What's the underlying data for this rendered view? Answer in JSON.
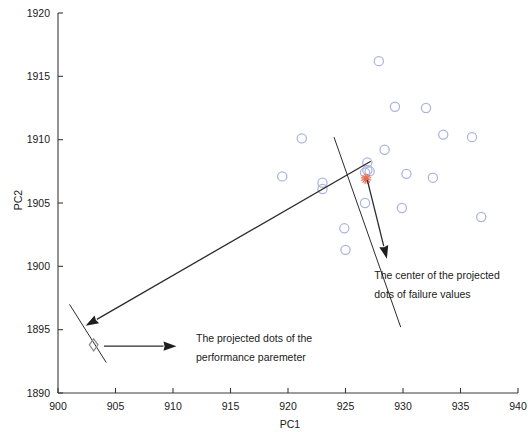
{
  "chart_data": {
    "type": "scatter",
    "title": "",
    "xlabel": "PC1",
    "ylabel": "PC2",
    "xlim": [
      900,
      940
    ],
    "ylim": [
      1890,
      1920
    ],
    "xticks": [
      900,
      905,
      910,
      915,
      920,
      925,
      930,
      935,
      940
    ],
    "xtick_labels": [
      "900",
      "905",
      "910",
      "915",
      "920",
      "925",
      "930",
      "935",
      "940"
    ],
    "yticks": [
      1890,
      1895,
      1900,
      1905,
      1910,
      1915,
      1920
    ],
    "ytick_labels": [
      "1890",
      "1895",
      "1900",
      "1905",
      "1910",
      "1915",
      "1920"
    ],
    "grid": false,
    "legend": null,
    "series": [
      {
        "name": "failure values",
        "marker": "open-circle",
        "color": "#aab4dd",
        "points": [
          {
            "x": 927.9,
            "y": 1916.2
          },
          {
            "x": 929.3,
            "y": 1912.6
          },
          {
            "x": 932.0,
            "y": 1912.5
          },
          {
            "x": 921.2,
            "y": 1910.1
          },
          {
            "x": 933.5,
            "y": 1910.4
          },
          {
            "x": 936.0,
            "y": 1910.2
          },
          {
            "x": 928.4,
            "y": 1909.2
          },
          {
            "x": 926.9,
            "y": 1908.2
          },
          {
            "x": 926.9,
            "y": 1907.6
          },
          {
            "x": 926.7,
            "y": 1907.4
          },
          {
            "x": 927.1,
            "y": 1907.5
          },
          {
            "x": 930.3,
            "y": 1907.3
          },
          {
            "x": 932.6,
            "y": 1907.0
          },
          {
            "x": 919.5,
            "y": 1907.1
          },
          {
            "x": 923.0,
            "y": 1906.6
          },
          {
            "x": 923.0,
            "y": 1906.1
          },
          {
            "x": 926.7,
            "y": 1905.0
          },
          {
            "x": 929.9,
            "y": 1904.6
          },
          {
            "x": 936.8,
            "y": 1903.9
          },
          {
            "x": 924.9,
            "y": 1903.0
          },
          {
            "x": 925.0,
            "y": 1901.3
          }
        ]
      },
      {
        "name": "center of projected failure dots",
        "marker": "asterisk",
        "color": "#e8694a",
        "points": [
          {
            "x": 926.8,
            "y": 1906.9
          }
        ]
      },
      {
        "name": "projected dots of the performance parameter",
        "marker": "open-diamond",
        "color": "#8a8a8a",
        "points": [
          {
            "x": 903.1,
            "y": 1893.8
          }
        ]
      }
    ],
    "annotations": [
      {
        "id": "failure-center-annotation",
        "lines": [
          "The center of the projected",
          "dots of failure values"
        ],
        "x": 927.5,
        "y": 1899.0
      },
      {
        "id": "performance-dots-annotation",
        "lines": [
          "The projected dots of the",
          "performance paremeter"
        ],
        "x": 912.0,
        "y": 1894.0
      }
    ],
    "arrows": [
      {
        "id": "arrow-to-performance-dots",
        "from": {
          "x": 927.2,
          "y": 1908.3
        },
        "to": {
          "x": 902.4,
          "y": 1895.3
        }
      },
      {
        "id": "arrow-to-failure-center-label",
        "from": {
          "x": 926.9,
          "y": 1906.8
        },
        "to": {
          "x": 928.6,
          "y": 1900.6
        }
      },
      {
        "id": "arrow-diamond-to-label",
        "from": {
          "x": 904.0,
          "y": 1893.7
        },
        "to": {
          "x": 910.3,
          "y": 1893.7
        }
      }
    ],
    "projection_axis_lines": [
      {
        "id": "projection-axis-upper",
        "from": {
          "x": 924.0,
          "y": 1910.2
        },
        "to": {
          "x": 929.8,
          "y": 1895.2
        }
      },
      {
        "id": "projection-axis-lower",
        "from": {
          "x": 901.0,
          "y": 1897.0
        },
        "to": {
          "x": 904.2,
          "y": 1892.4
        }
      }
    ]
  },
  "axes": {
    "x_title": "PC1",
    "y_title": "PC2"
  },
  "icons": {
    "circle": "open-circle-marker",
    "diamond": "open-diamond-marker",
    "asterisk": "asterisk-marker"
  }
}
